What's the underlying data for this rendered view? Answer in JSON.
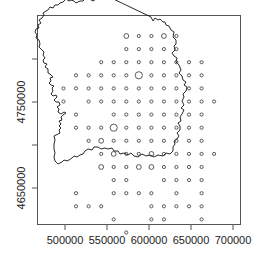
{
  "chart_data": {
    "type": "scatter",
    "title": "",
    "subtitle": "",
    "xlabel": "",
    "ylabel": "",
    "xlim": [
      467000,
      710000
    ],
    "ylim": [
      4608000,
      4850000
    ],
    "grid": false,
    "legend": null,
    "x_ticks": [
      {
        "value": 500000,
        "label": "500000"
      },
      {
        "value": 550000,
        "label": "550000"
      },
      {
        "value": 600000,
        "label": "600000"
      },
      {
        "value": 650000,
        "label": "650000"
      },
      {
        "value": 700000,
        "label": "700000"
      }
    ],
    "y_ticks": [
      {
        "value": 4650000,
        "label": "4650000",
        "labeled": true
      },
      {
        "value": 4700000,
        "label": "",
        "labeled": false
      },
      {
        "value": 4750000,
        "label": "4750000",
        "labeled": true
      },
      {
        "value": 4800000,
        "label": "",
        "labeled": false
      }
    ],
    "annotations": [],
    "points": [
      {
        "col": 5,
        "row": 0,
        "size": 2
      },
      {
        "col": 6,
        "row": 0,
        "size": 1
      },
      {
        "col": 7,
        "row": 0,
        "size": 1
      },
      {
        "col": 8,
        "row": 0,
        "size": 2
      },
      {
        "col": 9,
        "row": 0,
        "size": 1
      },
      {
        "col": 5,
        "row": 1,
        "size": 1
      },
      {
        "col": 6,
        "row": 1,
        "size": 1
      },
      {
        "col": 7,
        "row": 1,
        "size": 1
      },
      {
        "col": 8,
        "row": 1,
        "size": 1
      },
      {
        "col": 9,
        "row": 1,
        "size": 1
      },
      {
        "col": 3,
        "row": 2,
        "size": 1
      },
      {
        "col": 4,
        "row": 2,
        "size": 1
      },
      {
        "col": 5,
        "row": 2,
        "size": 1
      },
      {
        "col": 6,
        "row": 2,
        "size": 1
      },
      {
        "col": 7,
        "row": 2,
        "size": 1
      },
      {
        "col": 8,
        "row": 2,
        "size": 1
      },
      {
        "col": 9,
        "row": 2,
        "size": 1
      },
      {
        "col": 10,
        "row": 2,
        "size": 1
      },
      {
        "col": 11,
        "row": 2,
        "size": 1
      },
      {
        "col": 1,
        "row": 3,
        "size": 1
      },
      {
        "col": 2,
        "row": 3,
        "size": 1
      },
      {
        "col": 3,
        "row": 3,
        "size": 1
      },
      {
        "col": 4,
        "row": 3,
        "size": 1
      },
      {
        "col": 5,
        "row": 3,
        "size": 1
      },
      {
        "col": 6,
        "row": 3,
        "size": 3
      },
      {
        "col": 7,
        "row": 3,
        "size": 1
      },
      {
        "col": 8,
        "row": 3,
        "size": 1
      },
      {
        "col": 9,
        "row": 3,
        "size": 1
      },
      {
        "col": 10,
        "row": 3,
        "size": 1
      },
      {
        "col": 11,
        "row": 3,
        "size": 1
      },
      {
        "col": 0,
        "row": 4,
        "size": 1
      },
      {
        "col": 1,
        "row": 4,
        "size": 1
      },
      {
        "col": 2,
        "row": 4,
        "size": 1
      },
      {
        "col": 3,
        "row": 4,
        "size": 1
      },
      {
        "col": 4,
        "row": 4,
        "size": 1
      },
      {
        "col": 5,
        "row": 4,
        "size": 1
      },
      {
        "col": 6,
        "row": 4,
        "size": 1
      },
      {
        "col": 7,
        "row": 4,
        "size": 1
      },
      {
        "col": 8,
        "row": 4,
        "size": 1
      },
      {
        "col": 9,
        "row": 4,
        "size": 1
      },
      {
        "col": 10,
        "row": 4,
        "size": 1
      },
      {
        "col": 11,
        "row": 4,
        "size": 1
      },
      {
        "col": 0,
        "row": 5,
        "size": 1
      },
      {
        "col": 2,
        "row": 5,
        "size": 1
      },
      {
        "col": 3,
        "row": 5,
        "size": 1
      },
      {
        "col": 4,
        "row": 5,
        "size": 1
      },
      {
        "col": 5,
        "row": 5,
        "size": 1
      },
      {
        "col": 6,
        "row": 5,
        "size": 1
      },
      {
        "col": 7,
        "row": 5,
        "size": 1
      },
      {
        "col": 8,
        "row": 5,
        "size": 1
      },
      {
        "col": 9,
        "row": 5,
        "size": 1
      },
      {
        "col": 10,
        "row": 5,
        "size": 1
      },
      {
        "col": 11,
        "row": 5,
        "size": 1
      },
      {
        "col": 12,
        "row": 5,
        "size": 1
      },
      {
        "col": 1,
        "row": 6,
        "size": 1
      },
      {
        "col": 4,
        "row": 6,
        "size": 1
      },
      {
        "col": 5,
        "row": 6,
        "size": 1
      },
      {
        "col": 6,
        "row": 6,
        "size": 1
      },
      {
        "col": 7,
        "row": 6,
        "size": 1
      },
      {
        "col": 8,
        "row": 6,
        "size": 1
      },
      {
        "col": 9,
        "row": 6,
        "size": 1
      },
      {
        "col": 10,
        "row": 6,
        "size": 1
      },
      {
        "col": 11,
        "row": 6,
        "size": 1
      },
      {
        "col": 1,
        "row": 7,
        "size": 1
      },
      {
        "col": 2,
        "row": 7,
        "size": 1
      },
      {
        "col": 3,
        "row": 7,
        "size": 1
      },
      {
        "col": 4,
        "row": 7,
        "size": 3
      },
      {
        "col": 5,
        "row": 7,
        "size": 1
      },
      {
        "col": 6,
        "row": 7,
        "size": 1
      },
      {
        "col": 7,
        "row": 7,
        "size": 1
      },
      {
        "col": 8,
        "row": 7,
        "size": 1
      },
      {
        "col": 9,
        "row": 7,
        "size": 1
      },
      {
        "col": 10,
        "row": 7,
        "size": 1
      },
      {
        "col": 11,
        "row": 7,
        "size": 1
      },
      {
        "col": 2,
        "row": 8,
        "size": 1
      },
      {
        "col": 3,
        "row": 8,
        "size": 2
      },
      {
        "col": 4,
        "row": 8,
        "size": 1
      },
      {
        "col": 5,
        "row": 8,
        "size": 1
      },
      {
        "col": 6,
        "row": 8,
        "size": 1
      },
      {
        "col": 7,
        "row": 8,
        "size": 1
      },
      {
        "col": 8,
        "row": 8,
        "size": 1
      },
      {
        "col": 9,
        "row": 8,
        "size": 1
      },
      {
        "col": 10,
        "row": 8,
        "size": 1
      },
      {
        "col": 11,
        "row": 8,
        "size": 1
      },
      {
        "col": 3,
        "row": 9,
        "size": 1
      },
      {
        "col": 4,
        "row": 9,
        "size": 2
      },
      {
        "col": 5,
        "row": 9,
        "size": 1
      },
      {
        "col": 6,
        "row": 9,
        "size": 1
      },
      {
        "col": 7,
        "row": 9,
        "size": 2
      },
      {
        "col": 8,
        "row": 9,
        "size": 1
      },
      {
        "col": 9,
        "row": 9,
        "size": 1
      },
      {
        "col": 10,
        "row": 9,
        "size": 1
      },
      {
        "col": 11,
        "row": 9,
        "size": 1
      },
      {
        "col": 12,
        "row": 9,
        "size": 1
      },
      {
        "col": 3,
        "row": 10,
        "size": 2
      },
      {
        "col": 4,
        "row": 10,
        "size": 1
      },
      {
        "col": 5,
        "row": 10,
        "size": 1
      },
      {
        "col": 6,
        "row": 10,
        "size": 2
      },
      {
        "col": 7,
        "row": 10,
        "size": 2
      },
      {
        "col": 8,
        "row": 10,
        "size": 1
      },
      {
        "col": 9,
        "row": 10,
        "size": 1
      },
      {
        "col": 10,
        "row": 10,
        "size": 1
      },
      {
        "col": 11,
        "row": 10,
        "size": 1
      },
      {
        "col": 4,
        "row": 11,
        "size": 1
      },
      {
        "col": 5,
        "row": 11,
        "size": 1
      },
      {
        "col": 8,
        "row": 11,
        "size": 1
      },
      {
        "col": 9,
        "row": 11,
        "size": 1
      },
      {
        "col": 10,
        "row": 11,
        "size": 1
      },
      {
        "col": 11,
        "row": 11,
        "size": 1
      },
      {
        "col": 1,
        "row": 12,
        "size": 1
      },
      {
        "col": 4,
        "row": 12,
        "size": 1
      },
      {
        "col": 5,
        "row": 12,
        "size": 1
      },
      {
        "col": 6,
        "row": 12,
        "size": 1
      },
      {
        "col": 7,
        "row": 12,
        "size": 1
      },
      {
        "col": 9,
        "row": 12,
        "size": 1
      },
      {
        "col": 11,
        "row": 12,
        "size": 1
      },
      {
        "col": 1,
        "row": 13,
        "size": 1
      },
      {
        "col": 2,
        "row": 13,
        "size": 1
      },
      {
        "col": 3,
        "row": 13,
        "size": 1
      },
      {
        "col": 7,
        "row": 13,
        "size": 1
      },
      {
        "col": 8,
        "row": 13,
        "size": 1
      },
      {
        "col": 9,
        "row": 13,
        "size": 1
      },
      {
        "col": 10,
        "row": 13,
        "size": 1
      },
      {
        "col": 11,
        "row": 13,
        "size": 1
      },
      {
        "col": 4,
        "row": 14,
        "size": 1
      },
      {
        "col": 7,
        "row": 14,
        "size": 1
      },
      {
        "col": 8,
        "row": 14,
        "size": 1
      },
      {
        "col": 11,
        "row": 14,
        "size": 1
      },
      {
        "col": 5,
        "row": 15,
        "size": 1
      }
    ],
    "point_style": {
      "shape": "open-circle",
      "stroke": "#333333",
      "radius_by_size": [
        0,
        1.6,
        2.4,
        3.6
      ]
    }
  }
}
